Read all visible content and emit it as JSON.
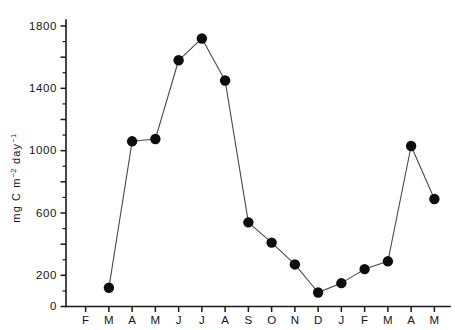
{
  "chart_data": {
    "type": "line",
    "title": "",
    "xlabel": "",
    "ylabel": "mg C m⁻² day⁻¹",
    "ylabel_parts": {
      "base1": "mg C m",
      "sup1": "−2",
      "base2": " day",
      "sup2": "−1"
    },
    "categories": [
      "F",
      "M",
      "A",
      "M",
      "J",
      "J",
      "A",
      "S",
      "O",
      "N",
      "D",
      "J",
      "F",
      "M",
      "A",
      "M"
    ],
    "values": [
      null,
      120,
      1060,
      1075,
      1580,
      1720,
      1450,
      540,
      410,
      270,
      90,
      150,
      240,
      290,
      1030,
      690
    ],
    "series": [
      {
        "name": "primary production",
        "values": [
          null,
          120,
          1060,
          1075,
          1580,
          1720,
          1450,
          540,
          410,
          270,
          90,
          150,
          240,
          290,
          1030,
          690
        ]
      }
    ],
    "ylim": [
      0,
      1900
    ],
    "ytick_labels": [
      "0",
      "200",
      "600",
      "1000",
      "1400",
      "1800"
    ],
    "ytick_values": [
      0,
      200,
      600,
      1000,
      1400,
      1800
    ],
    "yticks_major": [
      0,
      200,
      400,
      600,
      800,
      1000,
      1200,
      1400,
      1600,
      1800
    ],
    "yticks_minor": [
      100,
      300,
      500,
      700,
      900,
      1100,
      1300,
      1500,
      1700
    ],
    "grid": false,
    "legend": "none",
    "marker": "filled-circle",
    "marker_color": "#0d0d0d",
    "line_color": "#4a4a4a",
    "axis_color": "#1a1a1a"
  }
}
